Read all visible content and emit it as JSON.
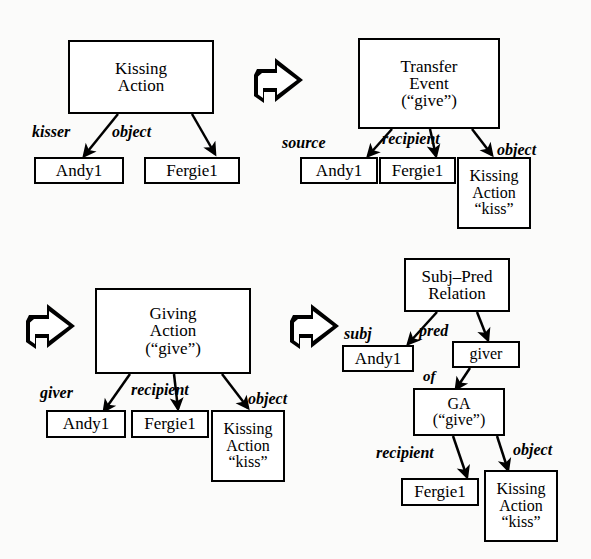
{
  "figure": {
    "background_color": "#fbfbfa",
    "ink_color": "#000000",
    "panel_count": 4
  },
  "bleed_through_text": {
    "line1": "",
    "line2": "",
    "line3": ""
  },
  "panels": [
    {
      "id": "panel-1",
      "name": "kissing-action-panel",
      "root": {
        "name": "kissing-action-node",
        "lines": [
          "Kissing",
          "Action"
        ]
      },
      "edges": [
        {
          "label": "kisser",
          "target": "Andy1"
        },
        {
          "label": "object",
          "target": "Fergie1"
        }
      ],
      "leaves": [
        {
          "name": "andy1-node",
          "lines": [
            "Andy1"
          ]
        },
        {
          "name": "fergie1-node",
          "lines": [
            "Fergie1"
          ]
        }
      ]
    },
    {
      "id": "panel-2",
      "name": "transfer-event-panel",
      "root": {
        "name": "transfer-event-node",
        "lines": [
          "Transfer",
          "Event",
          "(“give”)"
        ]
      },
      "edges": [
        {
          "label": "source",
          "target": "Andy1"
        },
        {
          "label": "recipient",
          "target": "Fergie1"
        },
        {
          "label": "object",
          "target": "Kissing Action “kiss”"
        }
      ],
      "leaves": [
        {
          "name": "andy1-node",
          "lines": [
            "Andy1"
          ]
        },
        {
          "name": "fergie1-node",
          "lines": [
            "Fergie1"
          ]
        },
        {
          "name": "kissing-action-kiss-node",
          "lines": [
            "Kissing",
            "Action",
            "“kiss”"
          ]
        }
      ]
    },
    {
      "id": "panel-3",
      "name": "giving-action-panel",
      "root": {
        "name": "giving-action-node",
        "lines": [
          "Giving",
          "Action",
          "(“give”)"
        ]
      },
      "edges": [
        {
          "label": "giver",
          "target": "Andy1"
        },
        {
          "label": "recipient",
          "target": "Fergie1"
        },
        {
          "label": "object",
          "target": "Kissing Action “kiss”"
        }
      ],
      "leaves": [
        {
          "name": "andy1-node",
          "lines": [
            "Andy1"
          ]
        },
        {
          "name": "fergie1-node",
          "lines": [
            "Fergie1"
          ]
        },
        {
          "name": "kissing-action-kiss-node",
          "lines": [
            "Kissing",
            "Action",
            "“kiss”"
          ]
        }
      ]
    },
    {
      "id": "panel-4",
      "name": "subj-pred-relation-panel",
      "root": {
        "name": "subj-pred-relation-node",
        "lines": [
          "Subj–Pred",
          "Relation"
        ]
      },
      "edges": [
        {
          "label": "subj",
          "target": "Andy1"
        },
        {
          "label": "pred",
          "target": "giver"
        },
        {
          "label": "of",
          "target": "GA (“give”)"
        },
        {
          "label": "recipient",
          "target": "Fergie1"
        },
        {
          "label": "object",
          "target": "Kissing Action “kiss”"
        }
      ],
      "leaves": [
        {
          "name": "andy1-node",
          "lines": [
            "Andy1"
          ]
        },
        {
          "name": "giver-node",
          "lines": [
            "giver"
          ]
        },
        {
          "name": "ga-give-node",
          "lines": [
            "GA",
            "(“give”)"
          ]
        },
        {
          "name": "fergie1-node",
          "lines": [
            "Fergie1"
          ]
        },
        {
          "name": "kissing-action-kiss-node",
          "lines": [
            "Kissing",
            "Action",
            "“kiss”"
          ]
        }
      ]
    }
  ],
  "nodes": {
    "p1_root_l1": "Kissing",
    "p1_root_l2": "Action",
    "p1_andy": "Andy1",
    "p1_fergie": "Fergie1",
    "p2_root_l1": "Transfer",
    "p2_root_l2": "Event",
    "p2_root_l3": "(“give”)",
    "p2_andy": "Andy1",
    "p2_fergie": "Fergie1",
    "p2_ka_l1": "Kissing",
    "p2_ka_l2": "Action",
    "p2_ka_l3": "“kiss”",
    "p3_root_l1": "Giving",
    "p3_root_l2": "Action",
    "p3_root_l3": "(“give”)",
    "p3_andy": "Andy1",
    "p3_fergie": "Fergie1",
    "p3_ka_l1": "Kissing",
    "p3_ka_l2": "Action",
    "p3_ka_l3": "“kiss”",
    "p4_root_l1": "Subj–Pred",
    "p4_root_l2": "Relation",
    "p4_andy": "Andy1",
    "p4_giver": "giver",
    "p4_ga_l1": "GA",
    "p4_ga_l2": "(“give”)",
    "p4_fergie": "Fergie1",
    "p4_ka_l1": "Kissing",
    "p4_ka_l2": "Action",
    "p4_ka_l3": "“kiss”"
  },
  "edge_labels": {
    "p1_kisser": "kisser",
    "p1_object": "object",
    "p2_source": "source",
    "p2_recipient": "recipient",
    "p2_object": "object",
    "p3_giver": "giver",
    "p3_recipient": "recipient",
    "p3_object": "object",
    "p4_subj": "subj",
    "p4_pred": "pred",
    "p4_of": "of",
    "p4_recipient": "recipient",
    "p4_object": "object"
  },
  "transform_arrows": [
    {
      "name": "transform-arrow-1",
      "direction": "right",
      "between": [
        "panel-1",
        "panel-2"
      ]
    },
    {
      "name": "transform-arrow-2",
      "direction": "right",
      "between": [
        "panel-2",
        "panel-3"
      ]
    },
    {
      "name": "transform-arrow-3",
      "direction": "right",
      "between": [
        "panel-3",
        "panel-4"
      ]
    }
  ]
}
